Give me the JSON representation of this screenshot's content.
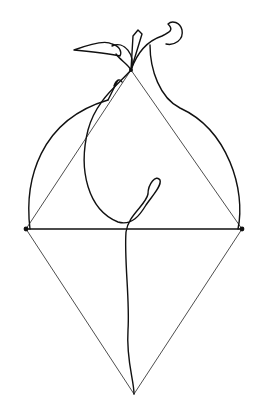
{
  "artwork": {
    "description": "Continuous line drawing of a pear-like figure with leaf and stem, overlaid by a rhombus (diamond) with a horizontal diagonal",
    "background": "#ffffff",
    "line_color": "#111111",
    "geometry": {
      "top_apex": [
        131,
        70
      ],
      "left_vertex": [
        26,
        229
      ],
      "right_vertex": [
        242,
        229
      ],
      "bottom_apex": [
        134,
        394
      ]
    }
  }
}
